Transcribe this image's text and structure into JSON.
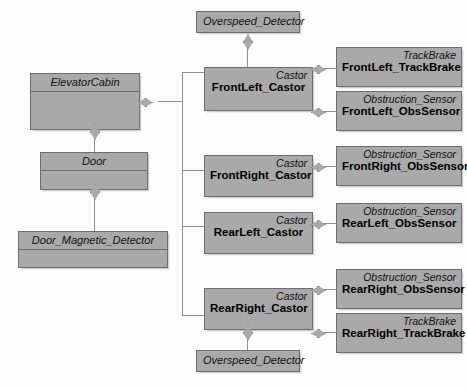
{
  "diagram": {
    "kind": "uml-composition-structure-diagram",
    "background_color": "#fdfdfd",
    "box_fill_color": "#a9a9a9",
    "box_border_color": "#6e6e6e",
    "line_color": "#8f8f8f"
  },
  "left_column": {
    "elevator_cabin": {
      "name": "ElevatorCabin"
    },
    "door": {
      "name": "Door"
    },
    "door_magnetic_detector": {
      "name": "Door_Magnetic_Detector"
    }
  },
  "center_column": {
    "overspeed_top": {
      "name": "Overspeed_Detector"
    },
    "overspeed_bottom": {
      "name": "Overspeed_Detector"
    },
    "castors": [
      {
        "stereotype": "Castor",
        "name": "FrontLeft_Castor"
      },
      {
        "stereotype": "Castor",
        "name": "FrontRight_Castor"
      },
      {
        "stereotype": "Castor",
        "name": "RearLeft_Castor"
      },
      {
        "stereotype": "Castor",
        "name": "RearRight_Castor"
      }
    ]
  },
  "right_column": {
    "parts": [
      {
        "stereotype": "TrackBrake",
        "name": "FrontLeft_TrackBrake"
      },
      {
        "stereotype": "Obstruction_Sensor",
        "name": "FrontLeft_ObsSensor"
      },
      {
        "stereotype": "Obstruction_Sensor",
        "name": "FrontRight_ObsSensor"
      },
      {
        "stereotype": "Obstruction_Sensor",
        "name": "RearLeft_ObsSensor"
      },
      {
        "stereotype": "Obstruction_Sensor",
        "name": "RearRight_ObsSensor"
      },
      {
        "stereotype": "TrackBrake",
        "name": "RearRight_TrackBrake"
      }
    ]
  }
}
